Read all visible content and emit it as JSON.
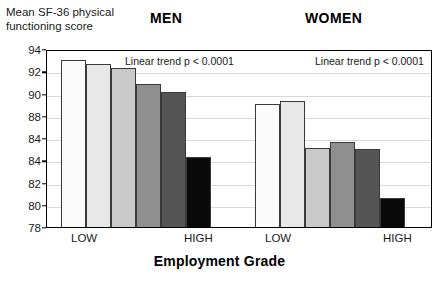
{
  "yaxis_title": "Mean SF-36 physical\nfunctioning score",
  "xaxis_title": "Employment Grade",
  "groups": {
    "men": {
      "header": "MEN",
      "annotation": "Linear trend p < 0.0001",
      "low_label": "LOW",
      "high_label": "HIGH"
    },
    "women": {
      "header": "WOMEN",
      "annotation": "Linear trend p < 0.0001",
      "low_label": "LOW",
      "high_label": "HIGH"
    }
  },
  "ytick_labels": [
    "94",
    "92",
    "90",
    "88",
    "84",
    "84",
    "82",
    "80",
    "78"
  ],
  "chart_data": {
    "type": "bar",
    "xlabel": "Employment Grade",
    "ylabel": "Mean SF-36 physical functioning score",
    "ylim": [
      78,
      94
    ],
    "ytick_values": [
      94,
      92,
      90,
      88,
      86,
      84,
      82,
      80,
      78
    ],
    "ytick_labels_as_printed": [
      "94",
      "92",
      "90",
      "88",
      "84",
      "84",
      "82",
      "80",
      "78"
    ],
    "grid": true,
    "legend": "none",
    "note": "Y tick at 86 is printed as '84' in the source image; reproduced as shown.",
    "panels": [
      {
        "name": "MEN",
        "annotation": "Linear trend p < 0.0001",
        "categories": [
          "1 (LOW)",
          "2",
          "3",
          "4",
          "5",
          "6 (HIGH)"
        ],
        "axis_end_labels": [
          "LOW",
          "HIGH"
        ],
        "values": [
          93.2,
          92.8,
          92.5,
          91.0,
          90.3,
          84.5
        ],
        "bar_colors": [
          "#fbfbfb",
          "#e8e8e8",
          "#c9c9c9",
          "#8f8f8f",
          "#555555",
          "#0a0a0a"
        ]
      },
      {
        "name": "WOMEN",
        "annotation": "Linear trend p < 0.0001",
        "categories": [
          "1 (LOW)",
          "2",
          "3",
          "4",
          "5",
          "6 (HIGH)"
        ],
        "axis_end_labels": [
          "LOW",
          "HIGH"
        ],
        "values": [
          89.2,
          89.5,
          85.3,
          85.8,
          85.2,
          80.8
        ],
        "bar_colors": [
          "#fbfbfb",
          "#e8e8e8",
          "#c9c9c9",
          "#8f8f8f",
          "#555555",
          "#0a0a0a"
        ]
      }
    ]
  }
}
